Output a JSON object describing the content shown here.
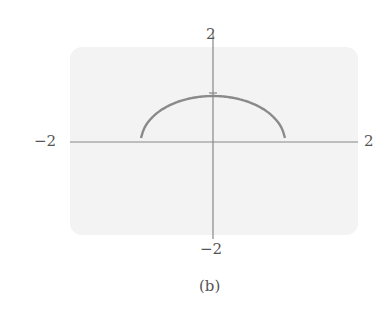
{
  "chart_data": {
    "type": "line",
    "title": "",
    "caption": "(b)",
    "xlabel": "",
    "ylabel": "",
    "xlim": [
      -2,
      2
    ],
    "ylim": [
      -2,
      2
    ],
    "grid": false,
    "tick_labels": {
      "x_left": "−2",
      "x_right": "2",
      "y_top": "2",
      "y_bottom": "−2"
    },
    "y_ticks": [
      1
    ],
    "series": [
      {
        "name": "lower semicircle y = -sqrt(1 - x^2)",
        "x": [
          -1,
          -0.9,
          -0.8,
          -0.6,
          -0.4,
          -0.2,
          0,
          0.2,
          0.4,
          0.6,
          0.8,
          0.9,
          1
        ],
        "y": [
          0,
          -0.44,
          -0.6,
          -0.8,
          -0.92,
          -0.98,
          -1,
          -0.98,
          -0.92,
          -0.8,
          -0.6,
          -0.44,
          0
        ]
      }
    ],
    "colors": {
      "background": "#f3f3f3",
      "axes": "#888888",
      "curve": "#8a8a8a"
    }
  }
}
